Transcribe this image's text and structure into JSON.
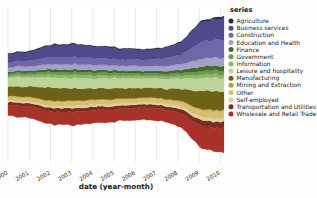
{
  "figure": {
    "background_color": "#fdfdfd",
    "panel_color": "#ffffff",
    "gridline_color": "#e4e4e4"
  },
  "axis": {
    "xlabel": "date (year-month)",
    "tick_labels": [
      "2000",
      "2001",
      "2002",
      "2003",
      "2004",
      "2005",
      "2006",
      "2007",
      "2008",
      "2009",
      "2010"
    ],
    "tick_rotation_deg": -30
  },
  "legend": {
    "title": "series",
    "position": "right",
    "marker": "circle"
  },
  "chart_data": {
    "type": "area",
    "subtype": "streamgraph",
    "title": "",
    "xlabel": "date (year-month)",
    "ylabel": "",
    "grid": true,
    "legend_position": "right",
    "legend_title": "series",
    "x": [
      "2000",
      "2001",
      "2002",
      "2003",
      "2004",
      "2005",
      "2006",
      "2007",
      "2008",
      "2009",
      "2010"
    ],
    "xlim": [
      "2000-01",
      "2010-02"
    ],
    "series": [
      {
        "name": "Agriculture",
        "color": "#2c2a4a",
        "values": [
          0.9,
          1.0,
          1.1,
          1.1,
          1.0,
          1.0,
          0.9,
          0.9,
          1.0,
          1.4,
          1.6
        ]
      },
      {
        "name": "Business services",
        "color": "#4f4a8c",
        "values": [
          7.0,
          7.5,
          10.5,
          11.0,
          10.0,
          9.5,
          8.8,
          8.6,
          10.5,
          17.5,
          19.0
        ]
      },
      {
        "name": "Construction",
        "color": "#6f68a8",
        "values": [
          4.5,
          4.8,
          6.0,
          6.2,
          5.9,
          5.6,
          5.4,
          6.0,
          8.5,
          15.0,
          16.0
        ]
      },
      {
        "name": "Education and Health",
        "color": "#a5a0c8",
        "values": [
          3.6,
          3.8,
          4.4,
          4.6,
          4.5,
          4.3,
          4.2,
          4.3,
          5.0,
          7.0,
          7.4
        ]
      },
      {
        "name": "Finance",
        "color": "#3f6b2b",
        "values": [
          1.9,
          2.0,
          2.4,
          2.5,
          2.4,
          2.3,
          2.2,
          2.3,
          2.9,
          4.0,
          4.2
        ]
      },
      {
        "name": "Government",
        "color": "#6b9a4e",
        "values": [
          2.0,
          2.1,
          2.4,
          2.5,
          2.4,
          2.3,
          2.3,
          2.3,
          2.6,
          3.3,
          3.5
        ]
      },
      {
        "name": "Information",
        "color": "#8fb56a",
        "values": [
          1.6,
          1.8,
          2.6,
          2.8,
          2.5,
          2.2,
          2.0,
          2.0,
          2.2,
          3.0,
          3.1
        ]
      },
      {
        "name": "Leisure and hospitality",
        "color": "#bcd49a",
        "values": [
          8.0,
          8.2,
          9.0,
          9.2,
          9.0,
          8.8,
          8.6,
          8.6,
          9.2,
          11.5,
          12.0
        ]
      },
      {
        "name": "Manufacturing",
        "color": "#6d6218",
        "values": [
          8.5,
          9.0,
          11.5,
          11.2,
          10.0,
          9.3,
          8.8,
          8.7,
          10.5,
          16.5,
          16.0
        ]
      },
      {
        "name": "Mining and Extraction",
        "color": "#b59b3c",
        "values": [
          0.5,
          0.5,
          0.6,
          0.6,
          0.5,
          0.5,
          0.5,
          0.5,
          0.6,
          0.9,
          1.0
        ]
      },
      {
        "name": "Other",
        "color": "#d7bf72",
        "values": [
          3.4,
          3.5,
          4.0,
          4.1,
          4.0,
          3.9,
          3.8,
          3.9,
          4.4,
          6.0,
          6.3
        ]
      },
      {
        "name": "Self-employed",
        "color": "#e0cfa0",
        "values": [
          1.5,
          1.6,
          1.8,
          1.9,
          1.8,
          1.8,
          1.7,
          1.8,
          2.1,
          3.0,
          3.2
        ]
      },
      {
        "name": "Transportation and Utilities",
        "color": "#7d2b1e",
        "values": [
          2.6,
          2.8,
          3.3,
          3.4,
          3.2,
          3.1,
          3.0,
          3.1,
          3.7,
          5.4,
          5.6
        ]
      },
      {
        "name": "Wholesale and Retail Trade",
        "color": "#a8322a",
        "values": [
          9.5,
          10.0,
          11.5,
          11.8,
          11.2,
          10.8,
          10.5,
          10.6,
          12.5,
          20.0,
          21.0
        ]
      }
    ]
  }
}
